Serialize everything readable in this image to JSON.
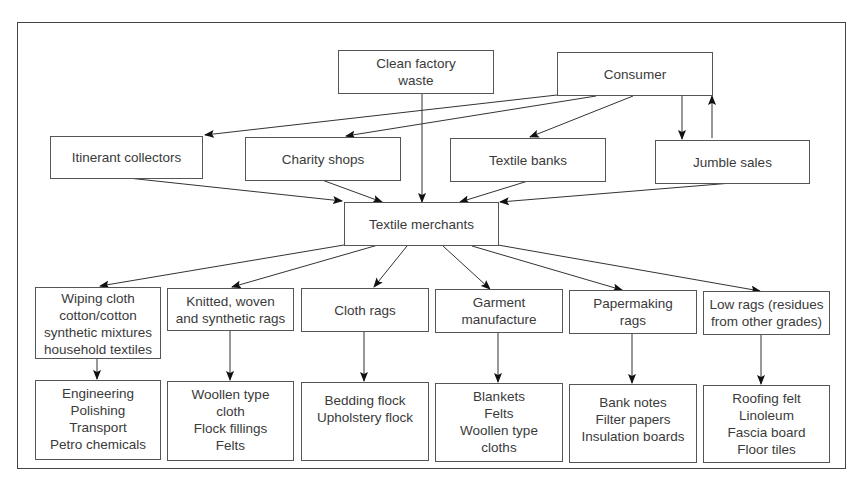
{
  "diagram": {
    "sources": {
      "clean_factory_waste": [
        "Clean factory",
        "waste"
      ],
      "consumer": "Consumer"
    },
    "channels": [
      "Itinerant collectors",
      "Charity shops",
      "Textile banks",
      "Jumble sales"
    ],
    "hub": "Textile merchants",
    "grades": [
      {
        "lines": [
          "Wiping cloth",
          "cotton/cotton",
          "synthetic mixtures",
          "household textiles"
        ],
        "uses": [
          "Engineering",
          "Polishing",
          "Transport",
          "Petro chemicals"
        ]
      },
      {
        "lines": [
          "Knitted, woven",
          "and synthetic rags"
        ],
        "uses": [
          "Woollen type",
          "cloth",
          "Flock fillings",
          "Felts"
        ]
      },
      {
        "lines": [
          "Cloth rags"
        ],
        "uses": [
          "Bedding flock",
          "Upholstery flock"
        ]
      },
      {
        "lines": [
          "Garment",
          "manufacture"
        ],
        "uses": [
          "Blankets",
          "Felts",
          "Woollen type",
          "cloths"
        ]
      },
      {
        "lines": [
          "Papermaking",
          "rags"
        ],
        "uses": [
          "Bank notes",
          "Filter papers",
          "Insulation boards"
        ]
      },
      {
        "lines": [
          "Low rags (residues",
          "from other grades)"
        ],
        "uses": [
          "Roofing felt",
          "Linoleum",
          "Fascia board",
          "Floor tiles"
        ]
      }
    ]
  }
}
